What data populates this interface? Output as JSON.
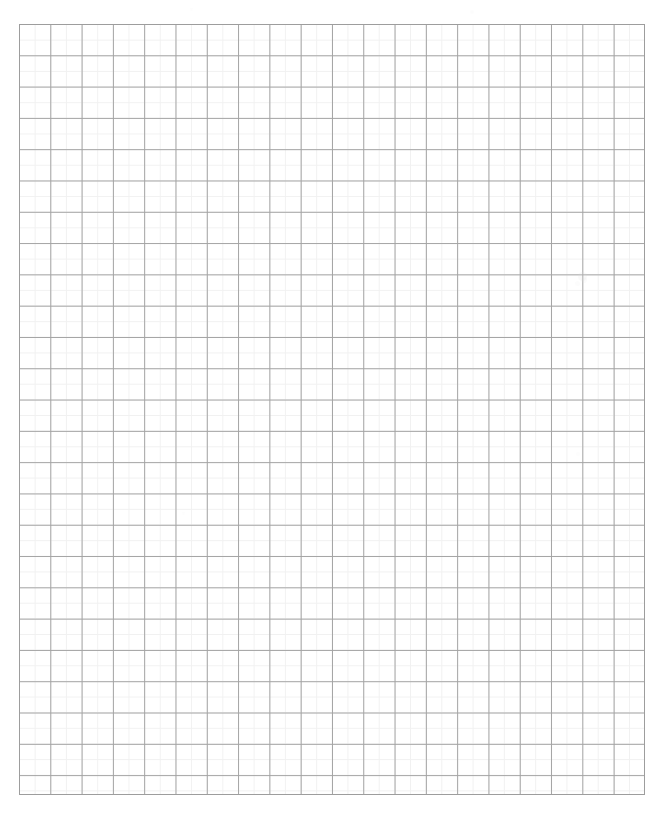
{
  "document": {
    "kind": "graph-paper",
    "title": "Blank graph paper sheet",
    "page_width": 667,
    "page_height": 817,
    "page_background": "#ffffff"
  },
  "grid": {
    "label": "Ruled square grid",
    "left": 19,
    "top": 24,
    "width": 626,
    "height": 771,
    "major_spacing": 31.3,
    "minor_spacing": 15.65,
    "major_columns": 20,
    "major_rows": 24,
    "minor_columns": 40,
    "minor_rows": 48,
    "major_color": "#a3a3a3",
    "minor_color": "#f1f1f1",
    "border_color": "#9d9d9d",
    "cell_fill": "#ffffff"
  },
  "artifacts": {
    "label": "Paper speckles",
    "items": [
      {
        "x": 578,
        "y": 272,
        "size": 9,
        "opacity": 0.3
      },
      {
        "x": 581,
        "y": 277,
        "size": 6,
        "opacity": 0.22
      },
      {
        "x": 575,
        "y": 281,
        "size": 5,
        "opacity": 0.18
      },
      {
        "x": 470,
        "y": 10,
        "size": 4,
        "opacity": 0.12
      },
      {
        "x": 190,
        "y": 8,
        "size": 3,
        "opacity": 0.1
      },
      {
        "x": 576,
        "y": 452,
        "size": 4,
        "opacity": 0.14
      },
      {
        "x": 182,
        "y": 512,
        "size": 3,
        "opacity": 0.1
      },
      {
        "x": 300,
        "y": 178,
        "size": 3,
        "opacity": 0.09
      }
    ]
  }
}
